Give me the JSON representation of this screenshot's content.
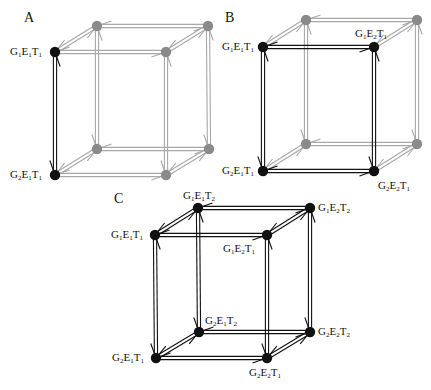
{
  "colors": {
    "active": "#111111",
    "inactive_line": "#a8a8a8",
    "inactive_node": "#8a8a8a"
  },
  "panels": [
    {
      "id": "A",
      "label": "A",
      "label_pos": [
        24,
        10
      ],
      "nodes": {
        "ftl": {
          "xy": [
            55,
            52
          ],
          "active": true,
          "text": [
            "G",
            "1",
            "E",
            "1",
            "T",
            "1"
          ],
          "label_pos": [
            10,
            46
          ]
        },
        "ftr": {
          "xy": [
            166,
            52
          ],
          "active": false
        },
        "btl": {
          "xy": [
            97,
            26
          ],
          "active": false
        },
        "btr": {
          "xy": [
            208,
            26
          ],
          "active": false
        },
        "fbl": {
          "xy": [
            55,
            175
          ],
          "active": true,
          "text": [
            "G",
            "2",
            "E",
            "1",
            "T",
            "1"
          ],
          "label_pos": [
            10,
            169
          ]
        },
        "fbr": {
          "xy": [
            166,
            175
          ],
          "active": false
        },
        "bbl": {
          "xy": [
            97,
            149
          ],
          "active": false
        },
        "bbr": {
          "xy": [
            209,
            149
          ],
          "active": false
        }
      },
      "active_edges": [
        [
          "ftl",
          "fbl"
        ]
      ]
    },
    {
      "id": "B",
      "label": "B",
      "label_pos": [
        225,
        10
      ],
      "nodes": {
        "ftl": {
          "xy": [
            263,
            47
          ],
          "active": true,
          "text": [
            "G",
            "1",
            "E",
            "1",
            "T",
            "1"
          ],
          "label_pos": [
            222,
            41
          ]
        },
        "ftr": {
          "xy": [
            374,
            47
          ],
          "active": true,
          "text": [
            "G",
            "1",
            "E",
            "2",
            "T",
            "1"
          ],
          "label_pos": [
            355,
            28
          ]
        },
        "btl": {
          "xy": [
            306,
            20
          ],
          "active": false
        },
        "btr": {
          "xy": [
            417,
            20
          ],
          "active": false
        },
        "fbl": {
          "xy": [
            263,
            171
          ],
          "active": true,
          "text": [
            "G",
            "2",
            "E",
            "1",
            "T",
            "1"
          ],
          "label_pos": [
            222,
            165
          ]
        },
        "fbr": {
          "xy": [
            374,
            171
          ],
          "active": true,
          "text": [
            "G",
            "2",
            "E",
            "2",
            "T",
            "1"
          ],
          "label_pos": [
            378,
            180
          ]
        },
        "bbl": {
          "xy": [
            306,
            144
          ],
          "active": false
        },
        "bbr": {
          "xy": [
            417,
            144
          ],
          "active": false
        }
      },
      "active_edges": [
        [
          "ftl",
          "ftr"
        ],
        [
          "ftl",
          "fbl"
        ],
        [
          "ftr",
          "fbr"
        ],
        [
          "fbl",
          "fbr"
        ]
      ]
    },
    {
      "id": "C",
      "label": "C",
      "label_pos": [
        114,
        191
      ],
      "nodes": {
        "ftl": {
          "xy": [
            155,
            235
          ],
          "active": true,
          "text": [
            "G",
            "1",
            "E",
            "1",
            "T",
            "1"
          ],
          "label_pos": [
            111,
            229
          ]
        },
        "ftr": {
          "xy": [
            267,
            235
          ],
          "active": true,
          "text": [
            "G",
            "1",
            "E",
            "2",
            "T",
            "1"
          ],
          "label_pos": [
            223,
            243
          ]
        },
        "btl": {
          "xy": [
            198,
            208
          ],
          "active": true,
          "text": [
            "G",
            "1",
            "E",
            "1",
            "T",
            "2"
          ],
          "label_pos": [
            183,
            190
          ]
        },
        "btr": {
          "xy": [
            310,
            208
          ],
          "active": true,
          "text": [
            "G",
            "1",
            "E",
            "2",
            "T",
            "2"
          ],
          "label_pos": [
            318,
            202
          ]
        },
        "fbl": {
          "xy": [
            156,
            358
          ],
          "active": true,
          "text": [
            "G",
            "2",
            "E",
            "1",
            "T",
            "1"
          ],
          "label_pos": [
            112,
            352
          ]
        },
        "fbr": {
          "xy": [
            267,
            358
          ],
          "active": true,
          "text": [
            "G",
            "2",
            "E",
            "2",
            "T",
            "1"
          ],
          "label_pos": [
            249,
            367
          ]
        },
        "bbl": {
          "xy": [
            199,
            332
          ],
          "active": true,
          "text": [
            "G",
            "2",
            "E",
            "1",
            "T",
            "2"
          ],
          "label_pos": [
            205,
            315
          ]
        },
        "bbr": {
          "xy": [
            310,
            332
          ],
          "active": true,
          "text": [
            "G",
            "2",
            "E",
            "2",
            "T",
            "2"
          ],
          "label_pos": [
            318,
            326
          ]
        }
      },
      "active_edges": "all"
    }
  ],
  "edges": [
    [
      "ftl",
      "ftr"
    ],
    [
      "btl",
      "btr"
    ],
    [
      "ftl",
      "btl"
    ],
    [
      "ftr",
      "btr"
    ],
    [
      "fbl",
      "fbr"
    ],
    [
      "bbl",
      "bbr"
    ],
    [
      "fbl",
      "bbl"
    ],
    [
      "fbr",
      "bbr"
    ],
    [
      "ftl",
      "fbl"
    ],
    [
      "ftr",
      "fbr"
    ],
    [
      "btl",
      "bbl"
    ],
    [
      "btr",
      "bbr"
    ]
  ]
}
